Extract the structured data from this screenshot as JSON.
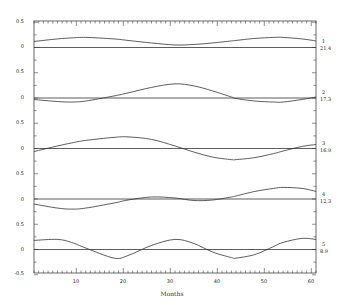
{
  "chart_data": {
    "type": "line",
    "title": "",
    "xlabel": "Months",
    "ylabel": "",
    "xlim": [
      1,
      61
    ],
    "x_ticks": [
      10,
      20,
      30,
      40,
      50,
      60
    ],
    "y_tick_labels_per_panel": [
      "0.5",
      "0",
      "-0.5"
    ],
    "grid": false,
    "legend": "right-side labels per panel",
    "x": [
      1,
      6,
      9,
      12,
      18,
      21,
      26,
      31,
      35,
      39,
      43,
      44,
      48,
      52,
      54,
      58,
      61
    ],
    "series": [
      {
        "name": "1",
        "annotation": "21.4",
        "values": [
          0.12,
          0.17,
          0.19,
          0.2,
          0.17,
          0.14,
          0.09,
          0.05,
          0.06,
          0.09,
          0.13,
          0.14,
          0.18,
          0.2,
          0.2,
          0.17,
          0.13
        ]
      },
      {
        "name": "2",
        "annotation": "17.3",
        "values": [
          -0.03,
          -0.07,
          -0.08,
          -0.06,
          0.04,
          0.1,
          0.21,
          0.28,
          0.24,
          0.14,
          0.02,
          -0.01,
          -0.06,
          -0.08,
          -0.08,
          -0.03,
          0.02
        ]
      },
      {
        "name": "3",
        "annotation": "16.9",
        "values": [
          -0.06,
          0.05,
          0.11,
          0.16,
          0.22,
          0.23,
          0.18,
          0.05,
          -0.07,
          -0.17,
          -0.22,
          -0.22,
          -0.18,
          -0.1,
          -0.05,
          0.04,
          0.08
        ]
      },
      {
        "name": "4",
        "annotation": "12.3",
        "values": [
          -0.1,
          -0.18,
          -0.2,
          -0.18,
          -0.08,
          -0.02,
          0.04,
          0.02,
          -0.03,
          -0.02,
          0.04,
          0.06,
          0.15,
          0.21,
          0.23,
          0.21,
          0.15
        ]
      },
      {
        "name": "5",
        "annotation": "8.9",
        "values": [
          0.18,
          0.2,
          0.14,
          0.03,
          -0.17,
          -0.12,
          0.08,
          0.2,
          0.12,
          -0.05,
          -0.16,
          -0.17,
          -0.1,
          0.06,
          0.14,
          0.22,
          0.2
        ]
      }
    ],
    "panel_offsets": [
      4,
      3,
      2,
      1,
      0
    ]
  },
  "labels": {
    "xlabel": "Months",
    "x_ticks": [
      "10",
      "20",
      "30",
      "40",
      "50",
      "60"
    ],
    "y_ticks": [
      "0.5",
      "0",
      "0.5",
      "0",
      "0.5",
      "0",
      "0.5",
      "0",
      "0.5",
      "0",
      "-0.5"
    ],
    "series_names": [
      "1",
      "2",
      "3",
      "4",
      "5"
    ],
    "series_values": [
      "21.4",
      "17.3",
      "16.9",
      "12.3",
      "8.9"
    ]
  }
}
